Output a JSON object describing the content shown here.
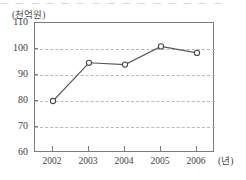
{
  "page": {
    "top_remnant_text": "ㅡ ㅡ  ㅡ ㅡ ㅡ  ㅡ ㅡ ㅡ ㅡ  ㅡ ㅡ ㅡ ㅡ  ㅡ  ㅡ"
  },
  "chart_data": {
    "type": "line",
    "title": "",
    "subtitle": "",
    "xlabel": "",
    "ylabel": "",
    "y_unit_label": "(천억원)",
    "x_unit_label": "(년)",
    "categories": [
      "2002",
      "2003",
      "2004",
      "2005",
      "2006"
    ],
    "x": [
      2002,
      2003,
      2004,
      2005,
      2006
    ],
    "values": [
      80,
      94.7,
      94,
      101,
      98.5
    ],
    "series": [
      {
        "name": "",
        "values": [
          80,
          94.7,
          94,
          101,
          98.5
        ]
      }
    ],
    "ylim": [
      60,
      110
    ],
    "yticks": [
      60,
      70,
      80,
      90,
      100,
      110
    ],
    "ytick_labels": [
      "60",
      "70",
      "80",
      "90",
      "100",
      "110"
    ],
    "xtick_labels": [
      "2002",
      "2003",
      "2004",
      "2005",
      "2006"
    ],
    "grid": true,
    "grid_style": "dashed-horizontal",
    "legend": false,
    "legend_position": "none",
    "marker": "open-circle",
    "line_color": "#5a5a5a",
    "marker_fill": "#ffffff",
    "marker_stroke": "#4a4a4a",
    "grid_color": "#b9b9b9",
    "axis_color": "#7d7d7d"
  }
}
